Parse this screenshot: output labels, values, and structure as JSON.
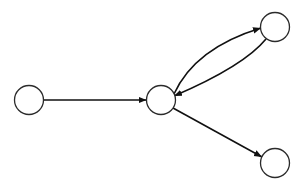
{
  "diagram": {
    "type": "directed-graph",
    "width": 303,
    "height": 188,
    "colors": {
      "background": "#ffffff",
      "node_stroke": "#2b2b2b",
      "node_fill": "#ffffff",
      "edge": "#111111"
    },
    "nodes": [
      {
        "id": "n0",
        "label": "",
        "cx": 29,
        "cy": 100,
        "r": 14.5
      },
      {
        "id": "n1",
        "label": "",
        "cx": 161,
        "cy": 100,
        "r": 14.5
      },
      {
        "id": "n2",
        "label": "",
        "cx": 275,
        "cy": 27,
        "r": 14.5
      },
      {
        "id": "n3",
        "label": "",
        "cx": 275,
        "cy": 163,
        "r": 14.5
      }
    ],
    "edges": [
      {
        "from": "n0",
        "to": "n1",
        "shape": "straight"
      },
      {
        "from": "n1",
        "to": "n2",
        "shape": "curved-upper"
      },
      {
        "from": "n2",
        "to": "n1",
        "shape": "curved-lower"
      },
      {
        "from": "n1",
        "to": "n3",
        "shape": "straight"
      }
    ]
  }
}
